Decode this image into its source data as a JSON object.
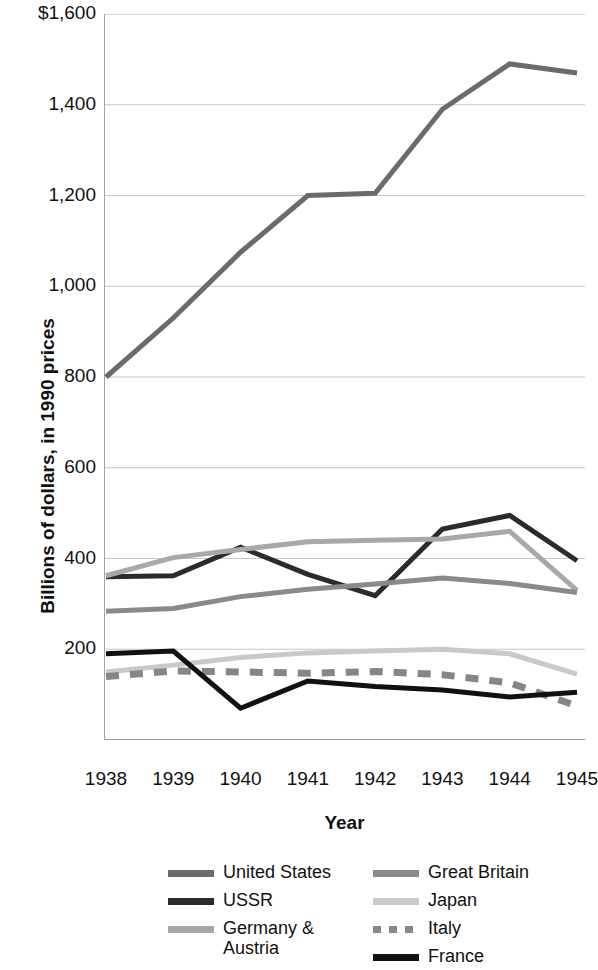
{
  "chart_data": {
    "type": "line",
    "title": "",
    "xlabel": "Year",
    "ylabel": "Billions of dollars, in 1990 prices",
    "x": [
      1938,
      1939,
      1940,
      1941,
      1942,
      1943,
      1944,
      1945
    ],
    "categories": [
      "1938",
      "1939",
      "1940",
      "1941",
      "1942",
      "1943",
      "1944",
      "1945"
    ],
    "xtick_labels": [
      "1938",
      "1939",
      "1940",
      "1941",
      "1942",
      "1943",
      "1944",
      "1945"
    ],
    "ytick_labels": [
      "$1,600",
      "1,400",
      "1,200",
      "1,000",
      "800",
      "600",
      "400",
      "200"
    ],
    "ytick_values": [
      1600,
      1400,
      1200,
      1000,
      800,
      600,
      400,
      200
    ],
    "ylim": [
      0,
      1600
    ],
    "xlim": [
      1938,
      1945
    ],
    "grid": "horizontal",
    "legend_position": "bottom",
    "legend_columns": 2,
    "series": [
      {
        "name": "United States",
        "color": "#6b6b6b",
        "style": "solid",
        "width": 5,
        "values": [
          800,
          930,
          1075,
          1200,
          1205,
          1390,
          1490,
          1470
        ]
      },
      {
        "name": "USSR",
        "color": "#2b2b2b",
        "style": "solid",
        "width": 5,
        "values": [
          360,
          362,
          425,
          365,
          318,
          465,
          495,
          395
        ]
      },
      {
        "name": "Germany & Austria",
        "color": "#a8a8a8",
        "style": "solid",
        "width": 5,
        "values": [
          362,
          402,
          420,
          437,
          440,
          443,
          460,
          330
        ]
      },
      {
        "name": "Great Britain",
        "color": "#8a8a8a",
        "style": "solid",
        "width": 5,
        "values": [
          284,
          290,
          316,
          332,
          344,
          357,
          345,
          325
        ]
      },
      {
        "name": "Japan",
        "color": "#c9c9c9",
        "style": "solid",
        "width": 5,
        "values": [
          150,
          165,
          182,
          192,
          196,
          200,
          190,
          145
        ]
      },
      {
        "name": "Italy",
        "color": "#868686",
        "style": "dashed",
        "width": 7,
        "values": [
          140,
          152,
          150,
          147,
          151,
          144,
          126,
          75
        ]
      },
      {
        "name": "France",
        "color": "#111111",
        "style": "solid",
        "width": 5,
        "values": [
          190,
          196,
          70,
          130,
          118,
          110,
          95,
          105
        ]
      }
    ]
  },
  "legend": {
    "left_column": [
      {
        "label": "United States",
        "label_line2": ""
      },
      {
        "label": "USSR",
        "label_line2": ""
      },
      {
        "label": "Germany &",
        "label_line2": "Austria"
      }
    ],
    "right_column": [
      {
        "label": "Great Britain",
        "label_line2": ""
      },
      {
        "label": "Japan",
        "label_line2": ""
      },
      {
        "label": "Italy",
        "label_line2": ""
      },
      {
        "label": "France",
        "label_line2": ""
      }
    ]
  }
}
